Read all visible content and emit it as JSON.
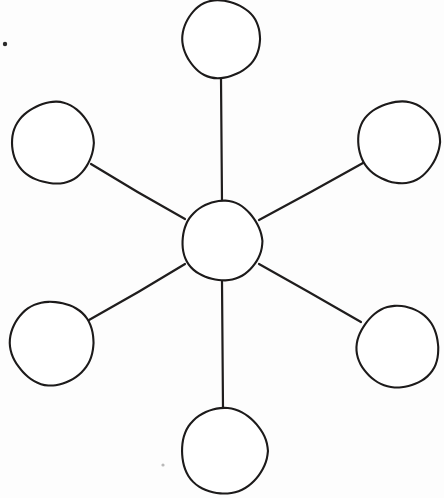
{
  "page": {
    "width": 444,
    "height": 498,
    "background_color": "#fdfdfd",
    "title": "Spider Web Graphic Organizer",
    "description": "Hand drawn blank spider map: one central circle connected by six straight lines to six empty outer circles."
  },
  "style": {
    "ink_color": "#1c1a1a",
    "line_color": "#1f1d1d",
    "circle_fill": "#ffffff",
    "circle_stroke_width": 2.1,
    "line_stroke_width": 2.2
  },
  "diagram": {
    "type": "spider-web",
    "center_label": "",
    "center": {
      "name": "center-node",
      "label": "",
      "cx": 222,
      "cy": 241,
      "r": 40
    },
    "nodes": [
      {
        "name": "node-top",
        "label": "",
        "cx": 221,
        "cy": 39,
        "r": 39,
        "angle_deg": 90
      },
      {
        "name": "node-upper-right",
        "label": "",
        "cx": 399,
        "cy": 142,
        "r": 41,
        "angle_deg": 30
      },
      {
        "name": "node-lower-right",
        "label": "",
        "cx": 398,
        "cy": 347,
        "r": 41,
        "angle_deg": -30
      },
      {
        "name": "node-bottom",
        "label": "",
        "cx": 224,
        "cy": 451,
        "r": 43,
        "angle_deg": -90
      },
      {
        "name": "node-lower-left",
        "label": "",
        "cx": 52,
        "cy": 343,
        "r": 42,
        "angle_deg": 210
      },
      {
        "name": "node-upper-left",
        "label": "",
        "cx": 53,
        "cy": 143,
        "r": 41,
        "angle_deg": 150
      }
    ],
    "connectors": [
      {
        "name": "spoke-top",
        "from": "center-node",
        "to": "node-top",
        "x1": 222,
        "y1": 203,
        "x2": 221,
        "y2": 78
      },
      {
        "name": "spoke-upper-right",
        "from": "center-node",
        "to": "node-upper-right",
        "x1": 259,
        "y1": 220,
        "x2": 363,
        "y2": 163
      },
      {
        "name": "spoke-lower-right",
        "from": "center-node",
        "to": "node-lower-right",
        "x1": 259,
        "y1": 264,
        "x2": 361,
        "y2": 322
      },
      {
        "name": "spoke-bottom",
        "from": "center-node",
        "to": "node-bottom",
        "x1": 222,
        "y1": 281,
        "x2": 223,
        "y2": 409
      },
      {
        "name": "spoke-lower-left",
        "from": "center-node",
        "to": "node-lower-left",
        "x1": 185,
        "y1": 264,
        "x2": 89,
        "y2": 320
      },
      {
        "name": "spoke-upper-left",
        "from": "center-node",
        "to": "node-upper-left",
        "x1": 185,
        "y1": 219,
        "x2": 91,
        "y2": 164
      }
    ],
    "artifacts": [
      {
        "name": "scan-speck-top-left",
        "cx": 5,
        "cy": 44,
        "r": 2.2,
        "tone": "dark"
      },
      {
        "name": "scan-speck-bottom-mid",
        "cx": 163,
        "cy": 465,
        "r": 1.6,
        "tone": "faint"
      }
    ]
  }
}
